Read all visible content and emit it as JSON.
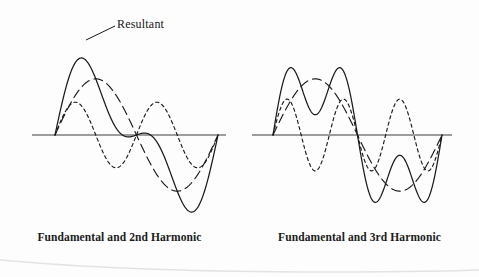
{
  "figure": {
    "annotation": {
      "label": "Resultant",
      "leader_from": [
        115,
        26
      ],
      "leader_to": [
        86,
        40
      ]
    },
    "axis_color": "#7d7d7d",
    "curve_color": "#1a1a1a",
    "background": "#fdfdfd"
  },
  "panels": [
    {
      "id": "left",
      "caption": "Fundamental and 2nd Harmonic",
      "axis": {
        "x_start": 32,
        "x_end": 226,
        "y": 135
      },
      "curve_domain": {
        "x_start": 55,
        "x_end": 218
      }
    },
    {
      "id": "right",
      "caption": "Fundamental and 3rd Harmonic",
      "axis": {
        "x_start": 12,
        "x_end": 212,
        "y": 135
      },
      "curve_domain": {
        "x_start": 33,
        "x_end": 202
      }
    }
  ],
  "chart_data": [
    {
      "type": "line",
      "title": "Fundamental and 2nd Harmonic",
      "xlabel": "",
      "ylabel": "",
      "grid": false,
      "legend": "annotation",
      "annotations": [
        "Resultant"
      ],
      "x_range": [
        0,
        1
      ],
      "y_range": [
        -1.6,
        1.6
      ],
      "series": [
        {
          "name": "Fundamental",
          "style": "long-dash",
          "amplitude": 0.72,
          "cycles": 1,
          "phase_deg": 0,
          "description": "sin(2*pi*x)"
        },
        {
          "name": "2nd Harmonic",
          "style": "short-dash",
          "amplitude": 0.42,
          "cycles": 2,
          "phase_deg": 0,
          "description": "0.42*sin(4*pi*x)"
        },
        {
          "name": "Resultant",
          "style": "solid",
          "description": "sum of fundamental and 2nd harmonic",
          "peak_value": 1.1,
          "trough_value": -1.1
        }
      ]
    },
    {
      "type": "line",
      "title": "Fundamental and 3rd Harmonic",
      "xlabel": "",
      "ylabel": "",
      "grid": false,
      "legend": "none",
      "annotations": [],
      "x_range": [
        0,
        1
      ],
      "y_range": [
        -1.6,
        1.6
      ],
      "series": [
        {
          "name": "Fundamental",
          "style": "long-dash",
          "amplitude": 0.72,
          "cycles": 1,
          "phase_deg": 0,
          "description": "sin(2*pi*x)"
        },
        {
          "name": "3rd Harmonic",
          "style": "short-dash",
          "amplitude": 0.46,
          "cycles": 3,
          "phase_deg": 0,
          "description": "0.46*sin(6*pi*x)"
        },
        {
          "name": "Resultant",
          "style": "solid",
          "description": "sum of fundamental and 3rd harmonic, double-humped",
          "peak_value": 1.12,
          "trough_value": -1.12
        }
      ]
    }
  ]
}
